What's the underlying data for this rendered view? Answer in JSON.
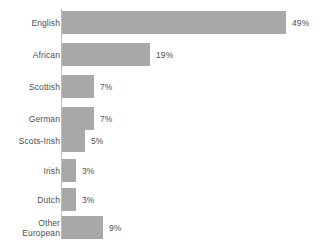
{
  "chart_data": {
    "type": "bar",
    "orientation": "horizontal",
    "title": "",
    "subtitle": "",
    "xlabel": "",
    "ylabel": "",
    "grid": false,
    "legend": false,
    "legend_position": "none",
    "axis_line": "vertical-left",
    "xlim": [
      0,
      49
    ],
    "bar_color": "#a8a8a8",
    "text_color": "#4f4f4f",
    "background_color": "#ffffff",
    "value_suffix": "%",
    "px_per_unit": 4.57,
    "categories": [
      "English",
      "African",
      "Scottish",
      "German",
      "Scots-Irish",
      "Irish",
      "Dutch",
      "Other\nEuropean"
    ],
    "values": [
      49,
      19,
      7,
      7,
      5,
      3,
      3,
      9
    ],
    "value_labels": [
      "49%",
      "19%",
      "7%",
      "7%",
      "5%",
      "3%",
      "3%",
      "9%"
    ]
  },
  "bars": [
    {
      "label": "English",
      "value": 49,
      "value_label": "49%",
      "top": 11,
      "width": 224
    },
    {
      "label": "African",
      "value": 19,
      "value_label": "19%",
      "top": 43,
      "width": 88
    },
    {
      "label": "Scottish",
      "value": 7,
      "value_label": "7%",
      "top": 75,
      "width": 32
    },
    {
      "label": "German",
      "value": 7,
      "value_label": "7%",
      "top": 107,
      "width": 32
    },
    {
      "label": "Scots-Irish",
      "value": 5,
      "value_label": "5%",
      "top": 129,
      "width": 23
    },
    {
      "label": "Irish",
      "value": 3,
      "value_label": "3%",
      "top": 159,
      "width": 14
    },
    {
      "label": "Dutch",
      "value": 3,
      "value_label": "3%",
      "top": 188,
      "width": 14
    },
    {
      "label": "Other\nEuropean",
      "value": 9,
      "value_label": "9%",
      "top": 216,
      "width": 41
    }
  ]
}
